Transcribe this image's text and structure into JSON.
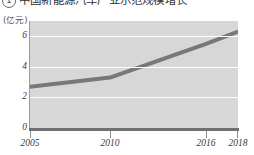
{
  "heading": {
    "marker": "1",
    "text": "中国新能源汽车产业示范规模增长"
  },
  "chart_data": {
    "type": "line",
    "title": "",
    "xlabel": "",
    "ylabel": "",
    "y_unit_label": "(亿元)",
    "x": [
      2005,
      2010,
      2016,
      2018
    ],
    "x_tick_labels": [
      "2005",
      "2010",
      "2016",
      "2018"
    ],
    "values": [
      2.7,
      3.3,
      5.5,
      6.3
    ],
    "series": [
      {
        "name": "规模",
        "values": [
          2.7,
          3.3,
          5.5,
          6.3
        ]
      }
    ],
    "y_ticks": [
      0,
      2,
      4,
      6
    ],
    "y_tick_labels": [
      "0",
      "2",
      "4",
      "6"
    ],
    "ylim": [
      0,
      7
    ],
    "xlim": [
      2005,
      2018
    ],
    "grid": true,
    "legend": "none",
    "colors": {
      "plot_background": "#d7d7d7",
      "gridline": "#fdfdfd",
      "line": "#787878",
      "axis": "#6f6f6f",
      "text": "#3c3a39"
    }
  }
}
